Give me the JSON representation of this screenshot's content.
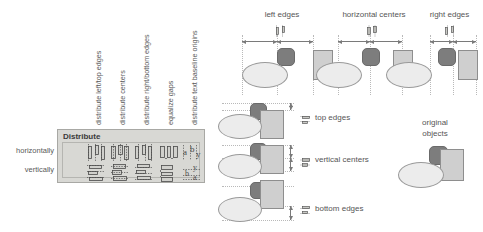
{
  "panel": {
    "title": "Distribute",
    "row_labels": {
      "horizontal": "horizontally",
      "vertical": "vertically"
    },
    "column_labels": [
      "distribute left/top edges",
      "distribute centers",
      "distribute right/bottom edges",
      "equalize gaps",
      "distribute text baseline origins"
    ],
    "buttons": [
      {
        "name": "distribute-horizontal-left-top-edges"
      },
      {
        "name": "distribute-horizontal-centers"
      },
      {
        "name": "distribute-horizontal-right-bottom-edges"
      },
      {
        "name": "distribute-horizontal-equalize-gaps"
      },
      {
        "name": "distribute-horizontal-text-baseline-origins"
      },
      {
        "name": "distribute-vertical-left-top-edges"
      },
      {
        "name": "distribute-vertical-centers"
      },
      {
        "name": "distribute-vertical-right-bottom-edges"
      },
      {
        "name": "distribute-vertical-equalize-gaps"
      },
      {
        "name": "distribute-vertical-text-baseline-origins"
      }
    ]
  },
  "diagrams": {
    "top_headers": [
      "left edges",
      "horizontal centers",
      "right edges"
    ],
    "row_labels": [
      "top edges",
      "vertical centers",
      "bottom edges"
    ],
    "original_label_line1": "original",
    "original_label_line2": "objects"
  },
  "colors": {
    "panel_bg": "#d8d8d4",
    "panel_border": "#a8a8a4",
    "ellipse_fill": "#ececec",
    "rect_fill": "#cfcfcf",
    "blob_fill": "#7d7d7d",
    "guide": "#b9b9b9",
    "text": "#585858"
  }
}
